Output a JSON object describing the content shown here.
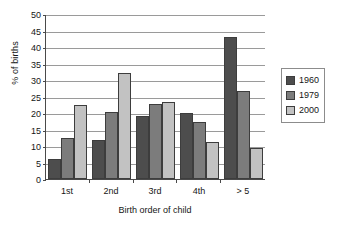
{
  "chart_data": {
    "type": "bar",
    "title": "",
    "xlabel": "Birth order of child",
    "ylabel": "% of births",
    "categories": [
      "1st",
      "2nd",
      "3rd",
      "4th",
      "> 5"
    ],
    "series": [
      {
        "name": "1960",
        "color": "#4d4d4d",
        "values": [
          6.1,
          11.9,
          19.2,
          20.0,
          43.1
        ]
      },
      {
        "name": "1979",
        "color": "#7c7c7c",
        "values": [
          12.4,
          20.3,
          22.7,
          17.4,
          26.7
        ]
      },
      {
        "name": "2000",
        "color": "#c2c2c2",
        "values": [
          22.4,
          32.2,
          23.3,
          11.3,
          9.5
        ]
      }
    ],
    "ylim": [
      0,
      50
    ],
    "ytick_step": 5,
    "yticks": [
      0,
      5,
      10,
      15,
      20,
      25,
      30,
      35,
      40,
      45,
      50
    ],
    "ytick_labels": [
      "0",
      "5",
      "10",
      "15",
      "20",
      "25",
      "30",
      "35",
      "40",
      "45",
      "50"
    ],
    "grid": true,
    "grid_axis": "y",
    "legend_position": "right",
    "legend_entries": [
      "1960",
      "1979",
      "2000"
    ]
  }
}
